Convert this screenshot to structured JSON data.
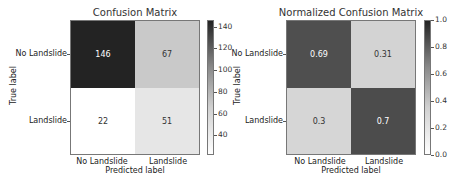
{
  "chart_data": [
    {
      "type": "heatmap",
      "title": "Confusion Matrix",
      "xlabel": "Predicted label",
      "ylabel": "True label",
      "x_categories": [
        "No Landslide",
        "Landslide"
      ],
      "y_categories": [
        "No Landslide",
        "Landslide"
      ],
      "values": [
        [
          146,
          67
        ],
        [
          22,
          51
        ]
      ],
      "colorbar": {
        "ticks": [
          "40",
          "60",
          "80",
          "100",
          "120",
          "140"
        ],
        "range": [
          22,
          146
        ]
      },
      "colormap": "Greys",
      "cell_colors": [
        [
          "#232323",
          "#c9c9c9"
        ],
        [
          "#ffffff",
          "#e6e6e6"
        ]
      ],
      "text_colors": [
        [
          "#ffffff",
          "#333333"
        ],
        [
          "#333333",
          "#333333"
        ]
      ]
    },
    {
      "type": "heatmap",
      "title": "Normalized Confusion Matrix",
      "xlabel": "Predicted label",
      "ylabel": "True label",
      "x_categories": [
        "No Landslide",
        "Landslide"
      ],
      "y_categories": [
        "No Landslide",
        "Landslide"
      ],
      "values": [
        [
          0.69,
          0.31
        ],
        [
          0.3,
          0.7
        ]
      ],
      "colorbar": {
        "ticks": [
          "0.0",
          "0.2",
          "0.4",
          "0.6",
          "0.8",
          "1.0"
        ],
        "range": [
          0.0,
          1.0
        ]
      },
      "colormap": "Greys",
      "cell_colors": [
        [
          "#4f4f4f",
          "#d3d3d3"
        ],
        [
          "#d6d6d6",
          "#4c4c4c"
        ]
      ],
      "text_colors": [
        [
          "#ffffff",
          "#333333"
        ],
        [
          "#333333",
          "#ffffff"
        ]
      ]
    }
  ]
}
